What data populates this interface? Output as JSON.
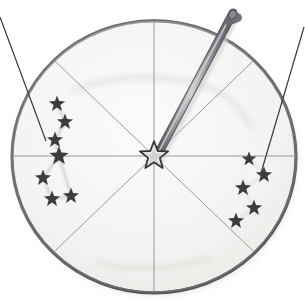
{
  "figure": {
    "medium": "pencil sketch",
    "background_color": "#ffffff",
    "canvas": {
      "width": 305,
      "height": 307
    }
  },
  "disc": {
    "name": "circular star disc",
    "center": {
      "x": 154,
      "y": 156
    },
    "radius": 142,
    "rim_color": "#6e6e72",
    "rim_shadow_color": "#4a4a50",
    "face_color": "#f7f7f5",
    "face_shading_color": "#ededea",
    "sector_count": 8,
    "divider_color": "#8b8b90",
    "divider_angles_deg": [
      0,
      45,
      90,
      135,
      180,
      225,
      270,
      315
    ]
  },
  "center_star": {
    "name": "center star marker",
    "x": 154,
    "y": 156,
    "size": 22,
    "color": "#3a3a3e"
  },
  "pointer": {
    "name": "pointer rod",
    "from": {
      "x": 156,
      "y": 158
    },
    "to": {
      "x": 233,
      "y": 13
    },
    "width": 9,
    "body_color": "#8d8d92",
    "edge_color": "#55555b",
    "highlight_color": "#c9c9cd",
    "tip_color": "#6a6a70"
  },
  "constellations": [
    {
      "name": "left constellation",
      "star_color": "#3c3c40",
      "trace_color": "#c6c6c9",
      "stars": [
        {
          "x": 57,
          "y": 104,
          "size": 11
        },
        {
          "x": 65,
          "y": 122,
          "size": 11
        },
        {
          "x": 55,
          "y": 140,
          "size": 11
        },
        {
          "x": 59,
          "y": 156,
          "size": 13
        },
        {
          "x": 43,
          "y": 178,
          "size": 11
        },
        {
          "x": 52,
          "y": 199,
          "size": 11
        },
        {
          "x": 71,
          "y": 196,
          "size": 11
        }
      ],
      "links": [
        [
          0,
          1
        ],
        [
          1,
          2
        ],
        [
          2,
          3
        ],
        [
          3,
          4
        ],
        [
          4,
          5
        ],
        [
          5,
          6
        ],
        [
          6,
          3
        ]
      ]
    },
    {
      "name": "right constellation",
      "star_color": "#3c3c40",
      "trace_color": "#d2d2d5",
      "stars": [
        {
          "x": 249,
          "y": 159,
          "size": 10
        },
        {
          "x": 264,
          "y": 175,
          "size": 11
        },
        {
          "x": 243,
          "y": 188,
          "size": 11
        },
        {
          "x": 254,
          "y": 208,
          "size": 11
        },
        {
          "x": 236,
          "y": 221,
          "size": 11
        }
      ],
      "links": [
        [
          0,
          1
        ],
        [
          1,
          2
        ],
        [
          2,
          3
        ],
        [
          3,
          4
        ]
      ]
    }
  ],
  "leader_lines": [
    {
      "name": "left leader line",
      "from": {
        "x": 0,
        "y": 17
      },
      "to": {
        "x": 46,
        "y": 141
      },
      "color": "#3a3a3e",
      "width": 1.2
    },
    {
      "name": "right leader line",
      "from": {
        "x": 304,
        "y": 27
      },
      "to": {
        "x": 261,
        "y": 173
      },
      "color": "#3a3a3e",
      "width": 1.2
    }
  ]
}
